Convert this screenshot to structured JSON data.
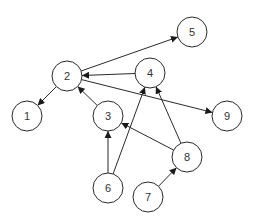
{
  "diagram": {
    "type": "directed-graph",
    "node_radius": 15,
    "colors": {
      "stroke": "#2a2a2a",
      "fill": "#ffffff",
      "text": "#333333",
      "background": "#ffffff"
    },
    "nodes": [
      {
        "id": "1",
        "label": "1",
        "x": 27,
        "y": 116
      },
      {
        "id": "2",
        "label": "2",
        "x": 67,
        "y": 76
      },
      {
        "id": "3",
        "label": "3",
        "x": 108,
        "y": 116
      },
      {
        "id": "4",
        "label": "4",
        "x": 150,
        "y": 73
      },
      {
        "id": "5",
        "label": "5",
        "x": 192,
        "y": 32
      },
      {
        "id": "6",
        "label": "6",
        "x": 108,
        "y": 188
      },
      {
        "id": "7",
        "label": "7",
        "x": 148,
        "y": 197
      },
      {
        "id": "8",
        "label": "8",
        "x": 187,
        "y": 157
      },
      {
        "id": "9",
        "label": "9",
        "x": 227,
        "y": 116
      }
    ],
    "edges": [
      {
        "from": "2",
        "to": "5"
      },
      {
        "from": "4",
        "to": "2"
      },
      {
        "from": "2",
        "to": "9"
      },
      {
        "from": "2",
        "to": "1"
      },
      {
        "from": "3",
        "to": "2"
      },
      {
        "from": "6",
        "to": "3"
      },
      {
        "from": "6",
        "to": "4"
      },
      {
        "from": "8",
        "to": "3"
      },
      {
        "from": "8",
        "to": "4"
      },
      {
        "from": "7",
        "to": "8"
      }
    ]
  }
}
